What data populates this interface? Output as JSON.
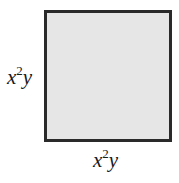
{
  "figure": {
    "shape": "square",
    "fill_color": "#e6e6e6",
    "border_color": "#2a2a2a",
    "side_label_left": {
      "base": "x",
      "exponent": "2",
      "tail": "y"
    },
    "side_label_bottom": {
      "base": "x",
      "exponent": "2",
      "tail": "y"
    }
  }
}
